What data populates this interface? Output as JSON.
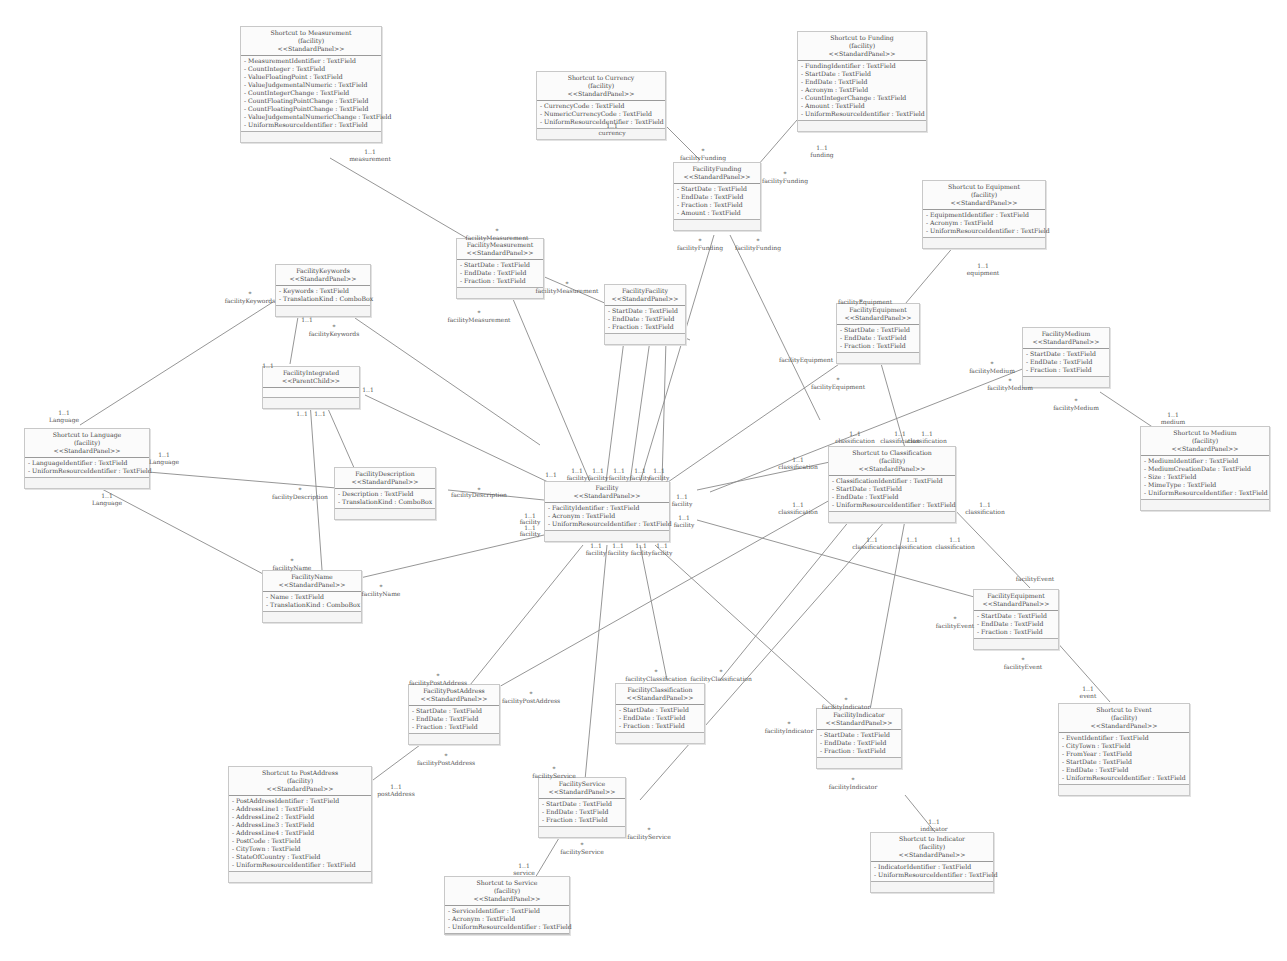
{
  "diagram": {
    "type": "uml-class-diagram",
    "classes": {
      "shortcut_measurement": {
        "title": "Shortcut to Measurement",
        "scope": "(facility)",
        "stereotype": "<<StandardPanel>>",
        "attrs": [
          "- MeasurementIdentifier : TextField",
          "- CountInteger : TextField",
          "- ValueFloatingPoint : TextField",
          "- ValueJudgementalNumeric : TextField",
          "- CountIntegerChange : TextField",
          "- CountFloatingPointChange : TextField",
          "- CountFloatingPointChange : TextField",
          "- ValueJudgementalNumericChange : TextField",
          "- UniformResourceIdentifier : TextField"
        ]
      },
      "shortcut_currency": {
        "title": "Shortcut to Currency",
        "scope": "(facility)",
        "stereotype": "<<StandardPanel>>",
        "attrs": [
          "- CurrencyCode : TextField",
          "- NumericCurrencyCode : TextField",
          "- UniformResourceIdentifier : TextField"
        ]
      },
      "shortcut_funding": {
        "title": "Shortcut to Funding",
        "scope": "(facility)",
        "stereotype": "<<StandardPanel>>",
        "attrs": [
          "- FundingIdentifier : TextField",
          "- StartDate : TextField",
          "- EndDate : TextField",
          "- Acronym : TextField",
          "- CountIntegerChange : TextField",
          "- Amount : TextField",
          "- UniformResourceIdentifier : TextField"
        ]
      },
      "facility_funding": {
        "title": "FacilityFunding",
        "stereotype": "<<StandardPanel>>",
        "attrs": [
          "- StartDate : TextField",
          "- EndDate : TextField",
          "- Fraction : TextField",
          "- Amount : TextField"
        ]
      },
      "facility_measurement": {
        "title": "FacilityMeasurement",
        "stereotype": "<<StandardPanel>>",
        "attrs": [
          "- StartDate : TextField",
          "- EndDate : TextField",
          "- Fraction : TextField"
        ]
      },
      "facility_facility": {
        "title": "FacilityFacility",
        "stereotype": "<<StandardPanel>>",
        "attrs": [
          "- StartDate : TextField",
          "- EndDate : TextField",
          "- Fraction : TextField"
        ]
      },
      "shortcut_equipment": {
        "title": "Shortcut to Equipment",
        "scope": "(facility)",
        "stereotype": "<<StandardPanel>>",
        "attrs": [
          "- EquipmentIdentifier : TextField",
          "- Acronym : TextField",
          "- UniformResourceIdentifier : TextField"
        ]
      },
      "facility_equipment": {
        "title": "FacilityEquipment",
        "stereotype": "<<StandardPanel>>",
        "attrs": [
          "- StartDate : TextField",
          "- EndDate : TextField",
          "- Fraction : TextField"
        ]
      },
      "facility_medium": {
        "title": "FacilityMedium",
        "stereotype": "<<StandardPanel>>",
        "attrs": [
          "- StartDate : TextField",
          "- EndDate : TextField",
          "- Fraction : TextField"
        ]
      },
      "shortcut_medium": {
        "title": "Shortcut to Medium",
        "scope": "(facility)",
        "stereotype": "<<StandardPanel>>",
        "attrs": [
          "- MediumIdentifier : TextField",
          "- MediumCreationDate : TextField",
          "- Size : TextField",
          "- MimeType : TextField",
          "- UniformResourceIdentifier : TextField"
        ]
      },
      "facility_keywords": {
        "title": "FacilityKeywords",
        "stereotype": "<<StandardPanel>>",
        "attrs": [
          "- Keywords : TextField",
          "- TranslationKind : ComboBox"
        ]
      },
      "facility_integrated": {
        "title": "FacilityIntegrated",
        "stereotype": "<<ParentChild>>",
        "attrs": []
      },
      "shortcut_language": {
        "title": "Shortcut to Language",
        "scope": "(facility)",
        "stereotype": "<<StandardPanel>>",
        "attrs": [
          "- LanguageIdentifier : TextField",
          "- UniformResourceIdentifier : TextField"
        ]
      },
      "facility_description": {
        "title": "FacilityDescription",
        "stereotype": "<<StandardPanel>>",
        "attrs": [
          "- Description : TextField",
          "- TranslationKind : ComboBox"
        ]
      },
      "facility": {
        "title": "Facility",
        "stereotype": "<<StandardPanel>>",
        "attrs": [
          "- FacilityIdentifier : TextField",
          "- Acronym : TextField",
          "- UniformResourceIdentifier : TextField"
        ]
      },
      "shortcut_classification": {
        "title": "Shortcut to Classification",
        "scope": "(facility)",
        "stereotype": "<<StandardPanel>>",
        "attrs": [
          "- ClassificationIdentifier : TextField",
          "- StartDate : TextField",
          "- EndDate : TextField",
          "- UniformResourceIdentifier : TextField"
        ]
      },
      "facility_name": {
        "title": "FacilityName",
        "stereotype": "<<StandardPanel>>",
        "attrs": [
          "- Name : TextField",
          "- TranslationKind : ComboBox"
        ]
      },
      "facility_event": {
        "title": "FacilityEquipment",
        "stereotype": "<<StandardPanel>>",
        "attrs": [
          "- StartDate : TextField",
          "- EndDate : TextField",
          "- Fraction : TextField"
        ]
      },
      "shortcut_event": {
        "title": "Shortcut to Event",
        "scope": "(facility)",
        "stereotype": "<<StandardPanel>>",
        "attrs": [
          "- EventIdentifier : TextField",
          "- CityTown : TextField",
          "- FromYear : TextField",
          "- StartDate : TextField",
          "- EndDate : TextField",
          "- UniformResourceIdentifier : TextField"
        ]
      },
      "facility_postaddress": {
        "title": "FacilityPostAddress",
        "stereotype": "<<StandardPanel>>",
        "attrs": [
          "- StartDate : TextField",
          "- EndDate : TextField",
          "- Fraction : TextField"
        ]
      },
      "facility_classification": {
        "title": "FacilityClassification",
        "stereotype": "<<StandardPanel>>",
        "attrs": [
          "- StartDate : TextField",
          "- EndDate : TextField",
          "- Fraction : TextField"
        ]
      },
      "facility_indicator": {
        "title": "FacilityIndicator",
        "stereotype": "<<StandardPanel>>",
        "attrs": [
          "- StartDate : TextField",
          "- EndDate : TextField",
          "- Fraction : TextField"
        ]
      },
      "shortcut_postaddress": {
        "title": "Shortcut to PostAddress",
        "scope": "(facility)",
        "stereotype": "<<StandardPanel>>",
        "attrs": [
          "- PostAddressIdentifier : TextField",
          "- AddressLine1 : TextField",
          "- AddressLine2 : TextField",
          "- AddressLine3 : TextField",
          "- AddressLine4 : TextField",
          "- PostCode : TextField",
          "- CityTown : TextField",
          "- StateOfCountry : TextField",
          "- UniformResourceIdentifier : TextField"
        ]
      },
      "facility_service": {
        "title": "FacilityService",
        "stereotype": "<<StandardPanel>>",
        "attrs": [
          "- StartDate : TextField",
          "- EndDate : TextField",
          "- Fraction : TextField"
        ]
      },
      "shortcut_service": {
        "title": "Shortcut to Service",
        "scope": "(facility)",
        "stereotype": "<<StandardPanel>>",
        "attrs": [
          "- ServiceIdentifier : TextField",
          "- Acronym : TextField",
          "- UniformResourceIdentifier : TextField"
        ]
      },
      "shortcut_indicator": {
        "title": "Shortcut to Indicator",
        "scope": "(facility)",
        "stereotype": "<<StandardPanel>>",
        "attrs": [
          "- IndicatorIdentifier : TextField",
          "- UniformResourceIdentifier : TextField"
        ]
      }
    },
    "labels": [
      {
        "x": 370,
        "y": 148,
        "text": "1..1"
      },
      {
        "x": 370,
        "y": 155,
        "text": "measurement"
      },
      {
        "x": 612,
        "y": 122,
        "text": "1..1"
      },
      {
        "x": 612,
        "y": 129,
        "text": "currency"
      },
      {
        "x": 822,
        "y": 144,
        "text": "1..1"
      },
      {
        "x": 822,
        "y": 151,
        "text": "funding"
      },
      {
        "x": 703,
        "y": 147,
        "text": "*"
      },
      {
        "x": 703,
        "y": 154,
        "text": "facilityFunding"
      },
      {
        "x": 785,
        "y": 170,
        "text": "*"
      },
      {
        "x": 785,
        "y": 177,
        "text": "facilityFunding"
      },
      {
        "x": 700,
        "y": 237,
        "text": "*"
      },
      {
        "x": 700,
        "y": 244,
        "text": "facilityFunding"
      },
      {
        "x": 758,
        "y": 237,
        "text": "*"
      },
      {
        "x": 758,
        "y": 244,
        "text": "facilityFunding"
      },
      {
        "x": 497,
        "y": 227,
        "text": "*"
      },
      {
        "x": 497,
        "y": 234,
        "text": "facilityMeasurement"
      },
      {
        "x": 567,
        "y": 280,
        "text": "*"
      },
      {
        "x": 567,
        "y": 287,
        "text": "facilityMeasurement"
      },
      {
        "x": 479,
        "y": 309,
        "text": "*"
      },
      {
        "x": 479,
        "y": 316,
        "text": "facilityMeasurement"
      },
      {
        "x": 250,
        "y": 290,
        "text": "*"
      },
      {
        "x": 250,
        "y": 297,
        "text": "facilityKeywords"
      },
      {
        "x": 334,
        "y": 323,
        "text": "*"
      },
      {
        "x": 334,
        "y": 330,
        "text": "facilityKeywords"
      },
      {
        "x": 307,
        "y": 316,
        "text": "1..1"
      },
      {
        "x": 268,
        "y": 362,
        "text": "1..1"
      },
      {
        "x": 368,
        "y": 386,
        "text": "1..1"
      },
      {
        "x": 302,
        "y": 410,
        "text": "1..1"
      },
      {
        "x": 320,
        "y": 410,
        "text": "1..1"
      },
      {
        "x": 64,
        "y": 409,
        "text": "1..1"
      },
      {
        "x": 64,
        "y": 416,
        "text": "Language"
      },
      {
        "x": 164,
        "y": 451,
        "text": "1..1"
      },
      {
        "x": 164,
        "y": 458,
        "text": "Language"
      },
      {
        "x": 107,
        "y": 492,
        "text": "1..1"
      },
      {
        "x": 107,
        "y": 499,
        "text": "Language"
      },
      {
        "x": 300,
        "y": 486,
        "text": "*"
      },
      {
        "x": 300,
        "y": 493,
        "text": "facilityDescription"
      },
      {
        "x": 479,
        "y": 486,
        "text": "*"
      },
      {
        "x": 479,
        "y": 491,
        "text": "facilityDescription"
      },
      {
        "x": 292,
        "y": 557,
        "text": "*"
      },
      {
        "x": 292,
        "y": 564,
        "text": "facilityName"
      },
      {
        "x": 381,
        "y": 583,
        "text": "*"
      },
      {
        "x": 381,
        "y": 590,
        "text": "facilityName"
      },
      {
        "x": 530,
        "y": 512,
        "text": "1..1"
      },
      {
        "x": 530,
        "y": 518,
        "text": "facility"
      },
      {
        "x": 530,
        "y": 524,
        "text": "1..1"
      },
      {
        "x": 530,
        "y": 530,
        "text": "facility"
      },
      {
        "x": 551,
        "y": 471,
        "text": "1..1"
      },
      {
        "x": 577,
        "y": 467,
        "text": "1..1"
      },
      {
        "x": 577,
        "y": 474,
        "text": "facility"
      },
      {
        "x": 598,
        "y": 467,
        "text": "1..1"
      },
      {
        "x": 598,
        "y": 474,
        "text": "facility"
      },
      {
        "x": 619,
        "y": 467,
        "text": "1..1"
      },
      {
        "x": 619,
        "y": 474,
        "text": "facility"
      },
      {
        "x": 640,
        "y": 467,
        "text": "1..1"
      },
      {
        "x": 640,
        "y": 474,
        "text": "facility"
      },
      {
        "x": 659,
        "y": 467,
        "text": "1..1"
      },
      {
        "x": 659,
        "y": 474,
        "text": "facility"
      },
      {
        "x": 682,
        "y": 493,
        "text": "1..1"
      },
      {
        "x": 682,
        "y": 500,
        "text": "facility"
      },
      {
        "x": 684,
        "y": 514,
        "text": "1..1"
      },
      {
        "x": 684,
        "y": 521,
        "text": "facility"
      },
      {
        "x": 596,
        "y": 542,
        "text": "1..1"
      },
      {
        "x": 596,
        "y": 549,
        "text": "facility"
      },
      {
        "x": 618,
        "y": 542,
        "text": "1..1"
      },
      {
        "x": 618,
        "y": 549,
        "text": "facility"
      },
      {
        "x": 641,
        "y": 542,
        "text": "1..1"
      },
      {
        "x": 641,
        "y": 549,
        "text": "facility"
      },
      {
        "x": 662,
        "y": 542,
        "text": "1..1"
      },
      {
        "x": 662,
        "y": 549,
        "text": "facility"
      },
      {
        "x": 861,
        "y": 298,
        "text": "*"
      },
      {
        "x": 865,
        "y": 298,
        "text": "facilityEquipment"
      },
      {
        "x": 806,
        "y": 356,
        "text": "facilityEquipment"
      },
      {
        "x": 838,
        "y": 376,
        "text": "*"
      },
      {
        "x": 838,
        "y": 383,
        "text": "facilityEquipment"
      },
      {
        "x": 983,
        "y": 262,
        "text": "1..1"
      },
      {
        "x": 983,
        "y": 269,
        "text": "equipment"
      },
      {
        "x": 992,
        "y": 360,
        "text": "*"
      },
      {
        "x": 992,
        "y": 367,
        "text": "facilityMedium"
      },
      {
        "x": 1010,
        "y": 377,
        "text": "*"
      },
      {
        "x": 1010,
        "y": 384,
        "text": "facilityMedium"
      },
      {
        "x": 1076,
        "y": 397,
        "text": "*"
      },
      {
        "x": 1076,
        "y": 404,
        "text": "facilityMedium"
      },
      {
        "x": 1173,
        "y": 411,
        "text": "1..1"
      },
      {
        "x": 1173,
        "y": 418,
        "text": "medium"
      },
      {
        "x": 855,
        "y": 430,
        "text": "1..1"
      },
      {
        "x": 855,
        "y": 437,
        "text": "classification"
      },
      {
        "x": 900,
        "y": 430,
        "text": "1..1"
      },
      {
        "x": 900,
        "y": 437,
        "text": "classification"
      },
      {
        "x": 927,
        "y": 430,
        "text": "1..1"
      },
      {
        "x": 927,
        "y": 437,
        "text": "classification"
      },
      {
        "x": 798,
        "y": 456,
        "text": "1..1"
      },
      {
        "x": 798,
        "y": 463,
        "text": "classification"
      },
      {
        "x": 798,
        "y": 501,
        "text": "1..1"
      },
      {
        "x": 798,
        "y": 508,
        "text": "classification"
      },
      {
        "x": 985,
        "y": 501,
        "text": "1..1"
      },
      {
        "x": 985,
        "y": 508,
        "text": "classification"
      },
      {
        "x": 872,
        "y": 536,
        "text": "1..1"
      },
      {
        "x": 872,
        "y": 543,
        "text": "classification"
      },
      {
        "x": 912,
        "y": 536,
        "text": "1..1"
      },
      {
        "x": 912,
        "y": 543,
        "text": "classification"
      },
      {
        "x": 955,
        "y": 536,
        "text": "1..1"
      },
      {
        "x": 955,
        "y": 543,
        "text": "classification"
      },
      {
        "x": 1035,
        "y": 575,
        "text": "facilityEvent"
      },
      {
        "x": 955,
        "y": 615,
        "text": "*"
      },
      {
        "x": 955,
        "y": 622,
        "text": "facilityEvent"
      },
      {
        "x": 1023,
        "y": 656,
        "text": "*"
      },
      {
        "x": 1023,
        "y": 663,
        "text": "facilityEvent"
      },
      {
        "x": 1088,
        "y": 685,
        "text": "1..1"
      },
      {
        "x": 1088,
        "y": 692,
        "text": "event"
      },
      {
        "x": 438,
        "y": 672,
        "text": "*"
      },
      {
        "x": 438,
        "y": 679,
        "text": "facilityPostAddress"
      },
      {
        "x": 531,
        "y": 690,
        "text": "*"
      },
      {
        "x": 531,
        "y": 697,
        "text": "facilityPostAddress"
      },
      {
        "x": 446,
        "y": 752,
        "text": "*"
      },
      {
        "x": 446,
        "y": 759,
        "text": "facilityPostAddress"
      },
      {
        "x": 396,
        "y": 783,
        "text": "1..1"
      },
      {
        "x": 396,
        "y": 790,
        "text": "postAddress"
      },
      {
        "x": 656,
        "y": 668,
        "text": "*"
      },
      {
        "x": 656,
        "y": 675,
        "text": "facilityClassification"
      },
      {
        "x": 721,
        "y": 668,
        "text": "*"
      },
      {
        "x": 721,
        "y": 675,
        "text": "facilityClassification"
      },
      {
        "x": 789,
        "y": 720,
        "text": "*"
      },
      {
        "x": 789,
        "y": 727,
        "text": "facilityIndicator"
      },
      {
        "x": 846,
        "y": 696,
        "text": "*"
      },
      {
        "x": 846,
        "y": 703,
        "text": "facilityIndicator"
      },
      {
        "x": 853,
        "y": 776,
        "text": "*"
      },
      {
        "x": 853,
        "y": 783,
        "text": "facilityIndicator"
      },
      {
        "x": 934,
        "y": 818,
        "text": "1..1"
      },
      {
        "x": 934,
        "y": 825,
        "text": "indicator"
      },
      {
        "x": 554,
        "y": 765,
        "text": "*"
      },
      {
        "x": 554,
        "y": 772,
        "text": "facilityService"
      },
      {
        "x": 649,
        "y": 826,
        "text": "*"
      },
      {
        "x": 649,
        "y": 833,
        "text": "facilityService"
      },
      {
        "x": 582,
        "y": 841,
        "text": "*"
      },
      {
        "x": 582,
        "y": 848,
        "text": "facilityService"
      },
      {
        "x": 524,
        "y": 862,
        "text": "1..1"
      },
      {
        "x": 524,
        "y": 869,
        "text": "service"
      }
    ]
  }
}
